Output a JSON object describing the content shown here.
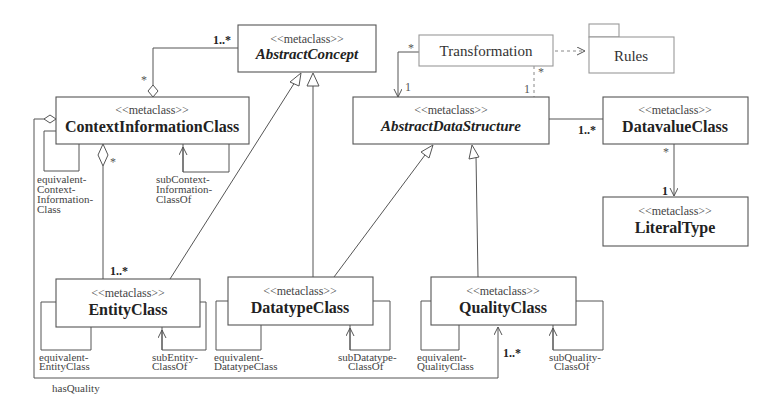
{
  "diagram": {
    "type": "UML class diagram (metamodel)",
    "stereotype": "<<metaclass>>",
    "classes": {
      "abstract_concept": {
        "stereotype": "<<metaclass>>",
        "name": "AbstractConcept",
        "abstract": true
      },
      "context_information_class": {
        "stereotype": "<<metaclass>>",
        "name": "ContextInformationClass",
        "abstract": false
      },
      "transformation": {
        "name": "Transformation"
      },
      "rules": {
        "name": "Rules",
        "kind": "package"
      },
      "abstract_data_structure": {
        "stereotype": "<<metaclass>>",
        "name": "AbstractDataStructure",
        "abstract": true
      },
      "datavalue_class": {
        "stereotype": "<<metaclass>>",
        "name": "DatavalueClass",
        "abstract": false
      },
      "literal_type": {
        "stereotype": "<<metaclass>>",
        "name": "LiteralType",
        "abstract": false
      },
      "entity_class": {
        "stereotype": "<<metaclass>>",
        "name": "EntityClass",
        "abstract": false
      },
      "datatype_class": {
        "stereotype": "<<metaclass>>",
        "name": "DatatypeClass",
        "abstract": false
      },
      "quality_class": {
        "stereotype": "<<metaclass>>",
        "name": "QualityClass",
        "abstract": false
      }
    },
    "multiplicities": {
      "cic_to_abstract_concept_target": "1..*",
      "cic_to_abstract_concept_source": "*",
      "cic_to_entity_source": "*",
      "cic_to_entity_target": "1..*",
      "transformation_left": "*",
      "transformation_ads_left": "1",
      "transformation_bottom": "*",
      "transformation_ads_right": "1",
      "ads_to_datavalue": "1..*",
      "datavalue_to_literal_source": "*",
      "datavalue_to_literal_target": "1",
      "has_quality_target": "1..*"
    },
    "roles": {
      "equivalent_context_information_class": [
        "equivalent-",
        "Context-",
        "Information-",
        "Class"
      ],
      "sub_context_information_class_of": [
        "subContext-",
        "Information-",
        "ClassOf"
      ],
      "equivalent_entity_class": [
        "equivalent-",
        "EntityClass"
      ],
      "sub_entity_class_of": [
        "subEntity-",
        "ClassOf"
      ],
      "equivalent_datatype_class": [
        "equivalent-",
        "DatatypeClass"
      ],
      "sub_datatype_class_of": [
        "subDatatype-",
        "ClassOf"
      ],
      "equivalent_quality_class": [
        "equivalent-",
        "QualityClass"
      ],
      "sub_quality_class_of": [
        "subQuality-",
        "ClassOf"
      ],
      "has_quality": "hasQuality"
    }
  }
}
